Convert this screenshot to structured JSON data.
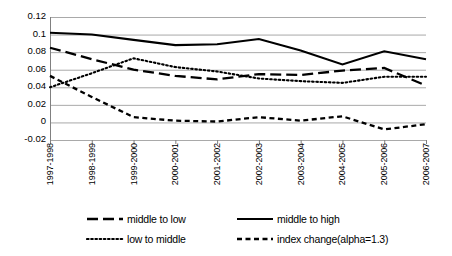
{
  "chart_data": {
    "type": "line",
    "title": "",
    "subtitle": "",
    "xlabel": "",
    "ylabel": "",
    "categories": [
      "1997-1998",
      "1998-1999",
      "1999-2000",
      "2000-2001",
      "2001-2002",
      "2002-2003",
      "2003-2004",
      "2004-2005",
      "2005-2006",
      "2006-2007"
    ],
    "ylim": [
      -0.02,
      0.12
    ],
    "ytick_labels": [
      "0.12",
      "0.1",
      "0.08",
      "0.06",
      "0.04",
      "0.02",
      "0",
      "-0.02"
    ],
    "ytick_values": [
      0.12,
      0.1,
      0.08,
      0.06,
      0.04,
      0.02,
      0,
      -0.02
    ],
    "grid": true,
    "legend_position": "bottom",
    "series": [
      {
        "name": "middle to low",
        "style": "long-dash",
        "color": "#000000",
        "values": [
          0.085,
          0.072,
          0.06,
          0.053,
          0.049,
          0.055,
          0.054,
          0.059,
          0.062,
          0.042
        ]
      },
      {
        "name": "middle to high",
        "style": "solid",
        "color": "#000000",
        "values": [
          0.102,
          0.1,
          0.094,
          0.088,
          0.089,
          0.095,
          0.082,
          0.066,
          0.081,
          0.072
        ]
      },
      {
        "name": "low to middle",
        "style": "dotted",
        "color": "#000000",
        "values": [
          0.04,
          0.056,
          0.073,
          0.063,
          0.058,
          0.05,
          0.047,
          0.045,
          0.052,
          0.052
        ]
      },
      {
        "name": "index change(alpha=1.3)",
        "style": "short-dash",
        "color": "#000000",
        "values": [
          0.053,
          0.029,
          0.006,
          0.002,
          0.001,
          0.006,
          0.002,
          0.007,
          -0.008,
          -0.002
        ]
      }
    ]
  },
  "legend": {
    "items": [
      {
        "label": "middle to low",
        "style": "long-dash"
      },
      {
        "label": "middle to high",
        "style": "solid"
      },
      {
        "label": "low to middle",
        "style": "dotted"
      },
      {
        "label": "index change(alpha=1.3)",
        "style": "short-dash"
      }
    ]
  }
}
